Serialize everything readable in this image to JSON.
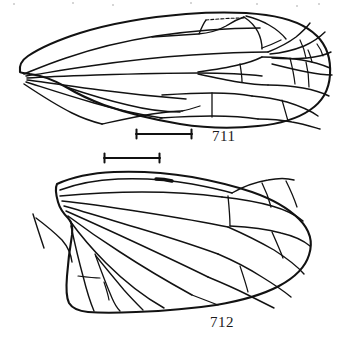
{
  "plate": {
    "kind": "scientific-line-drawing",
    "subject": "insect wing venation",
    "background_color": "#ffffff",
    "ink_color": "#111111",
    "figures": [
      {
        "id": "fig-711",
        "number": "711",
        "caption": "711",
        "wing_type": "forewing",
        "label_position": {
          "x": 212,
          "y": 128
        },
        "scale_bar": {
          "name": "scale-bar-711",
          "x1": 136,
          "x2": 192,
          "y": 134,
          "length_px": 56,
          "tick_height_px": 9
        }
      },
      {
        "id": "fig-712",
        "number": "712",
        "caption": "712",
        "wing_type": "hindwing",
        "label_position": {
          "x": 210,
          "y": 314
        },
        "scale_bar": {
          "name": "scale-bar-712",
          "x1": 104,
          "x2": 160,
          "y": 158,
          "length_px": 56,
          "tick_height_px": 9
        }
      }
    ],
    "artifacts": {
      "top_speckles": [
        {
          "x": 13,
          "y": 3
        },
        {
          "x": 72,
          "y": 2
        },
        {
          "x": 112,
          "y": 4
        },
        {
          "x": 190,
          "y": 2
        },
        {
          "x": 256,
          "y": 3
        },
        {
          "x": 296,
          "y": 5
        },
        {
          "x": 318,
          "y": 3
        }
      ]
    }
  }
}
